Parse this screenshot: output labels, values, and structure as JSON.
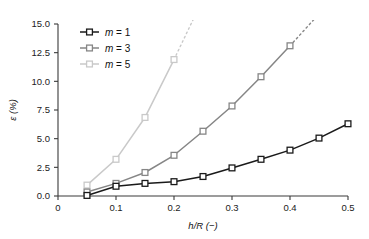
{
  "chart_data": {
    "type": "line",
    "title": "",
    "subtitle": "",
    "xlabel": "h/R (−)",
    "ylabel": "ε (%)",
    "xlim": [
      0,
      0.5
    ],
    "ylim": [
      0,
      15.0
    ],
    "grid": false,
    "legend_position": "top-left-inside",
    "x_ticks": [
      "0",
      "0.1",
      "0.2",
      "0.3",
      "0.4",
      "0.5"
    ],
    "x_tick_values": [
      0,
      0.1,
      0.2,
      0.3,
      0.4,
      0.5
    ],
    "y_ticks": [
      "0.0",
      "2.5",
      "5.0",
      "7.5",
      "10.0",
      "12.5",
      "15.0"
    ],
    "y_tick_values": [
      0.0,
      2.5,
      5.0,
      7.5,
      10.0,
      12.5,
      15.0
    ],
    "marker": "square-open",
    "series": [
      {
        "name": "m = 1",
        "legend_label": "m = 1",
        "color": "#1a1a1a",
        "x": [
          0.05,
          0.1,
          0.15,
          0.2,
          0.25,
          0.3,
          0.35,
          0.4,
          0.45,
          0.5
        ],
        "values": [
          0.05,
          0.85,
          1.1,
          1.25,
          1.7,
          2.45,
          3.2,
          4.0,
          5.05,
          6.3
        ],
        "dashed_extension": false
      },
      {
        "name": "m = 3",
        "legend_label": "m = 3",
        "color": "#868686",
        "x": [
          0.05,
          0.1,
          0.15,
          0.2,
          0.25,
          0.3,
          0.35,
          0.4
        ],
        "values": [
          0.35,
          1.1,
          2.05,
          3.55,
          5.65,
          7.85,
          10.4,
          13.1
        ],
        "dashed_extension": true,
        "dashed_to": [
          0.445,
          15.6
        ]
      },
      {
        "name": "m = 5",
        "legend_label": "m = 5",
        "color": "#c9c9c9",
        "x": [
          0.05,
          0.1,
          0.15,
          0.2
        ],
        "values": [
          0.95,
          3.2,
          6.85,
          11.9
        ],
        "dashed_extension": true,
        "dashed_to": [
          0.235,
          15.6
        ]
      }
    ]
  },
  "legend": {
    "items": [
      {
        "label": "m = 1"
      },
      {
        "label": "m = 3"
      },
      {
        "label": "m = 5"
      }
    ]
  },
  "axes": {
    "x_title": "h/R (−)",
    "y_title": "ε (%)"
  }
}
